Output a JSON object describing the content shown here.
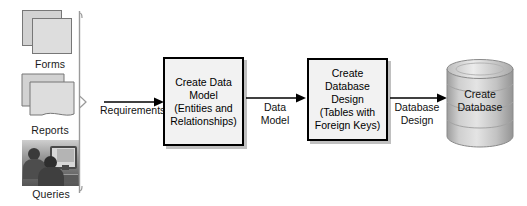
{
  "diagram": {
    "sources": [
      {
        "id": "forms",
        "label": "Forms",
        "icon": "stacked-documents-icon"
      },
      {
        "id": "reports",
        "label": "Reports",
        "icon": "stacked-reports-icon"
      },
      {
        "id": "queries",
        "label": "Queries",
        "icon": "users-at-computer-photo-icon"
      }
    ],
    "flows": [
      {
        "id": "requirements",
        "label": "Requirements"
      },
      {
        "id": "data-model",
        "label_line1": "Data",
        "label_line2": "Model"
      },
      {
        "id": "database-design",
        "label_line1": "Database",
        "label_line2": "Design"
      }
    ],
    "processes": [
      {
        "id": "create-data-model",
        "lines": [
          "Create Data",
          "Model",
          "(Entities and",
          "Relationships)"
        ]
      },
      {
        "id": "create-database-design",
        "lines": [
          "Create",
          "Database",
          "Design",
          "(Tables with",
          "Foreign Keys)"
        ]
      }
    ],
    "datastore": {
      "id": "create-database",
      "lines": [
        "Create",
        "Database"
      ],
      "shape": "cylinder"
    },
    "colors": {
      "background": "#ffffff",
      "box_fill": "#f2f2f2",
      "box_border": "#000000",
      "box_shadow": "#8c8c8c",
      "icon_fill": "#d9d9d9",
      "icon_border": "#777777",
      "cylinder_light": "#e2e2e2",
      "cylinder_mid": "#b8b8b8",
      "cylinder_dark": "#8f8f8f",
      "arrow": "#000000",
      "bracket": "#9a9a9a",
      "text": "#111111"
    }
  }
}
